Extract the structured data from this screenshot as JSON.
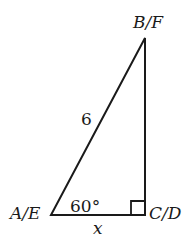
{
  "diagram": {
    "type": "right-triangle",
    "vertices": {
      "top": "B/F",
      "bottom_left": "A/E",
      "bottom_right": "C/D"
    },
    "hypotenuse_label": "6",
    "base_label": "x",
    "angle_label": "60°",
    "right_angle_at": "C/D",
    "colors": {
      "stroke": "#1a1a1a",
      "background": "#ffffff"
    }
  }
}
